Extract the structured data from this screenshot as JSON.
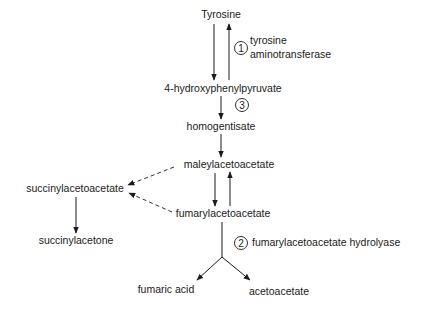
{
  "diagram": {
    "type": "metabolic-pathway",
    "nodes": {
      "tyrosine": "Tyrosine",
      "hydroxyphenylpyruvate": "4-hydroxyphenylpyruvate",
      "homogentisate": "homogentisate",
      "maleylacetoacetate": "maleylacetoacetate",
      "fumarylacetoacetate": "fumarylacetoacetate",
      "succinylacetoacetate": "succinylacetoacetate",
      "succinylacetone": "succinylacetone",
      "fumaric_acid": "fumaric acid",
      "acetoacetate": "acetoacetate"
    },
    "enzymes": [
      {
        "number": "1",
        "line1": "tyrosine",
        "line2": "aminotransferase"
      },
      {
        "number": "2",
        "line1": "fumarylacetoacetate hydrolyase"
      },
      {
        "number": "3"
      }
    ],
    "edges": [
      {
        "from": "Tyrosine",
        "to": "4-hydroxyphenylpyruvate",
        "style": "solid",
        "reversible": true,
        "enzyme": "1"
      },
      {
        "from": "4-hydroxyphenylpyruvate",
        "to": "homogentisate",
        "style": "solid",
        "enzyme": "3"
      },
      {
        "from": "homogentisate",
        "to": "maleylacetoacetate",
        "style": "solid"
      },
      {
        "from": "maleylacetoacetate",
        "to": "fumarylacetoacetate",
        "style": "solid",
        "reversible": true
      },
      {
        "from": "maleylacetoacetate",
        "to": "succinylacetoacetate",
        "style": "dashed"
      },
      {
        "from": "fumarylacetoacetate",
        "to": "succinylacetoacetate",
        "style": "dashed"
      },
      {
        "from": "succinylacetoacetate",
        "to": "succinylacetone",
        "style": "solid"
      },
      {
        "from": "fumarylacetoacetate",
        "to": "fumaric acid",
        "style": "solid",
        "enzyme": "2"
      },
      {
        "from": "fumarylacetoacetate",
        "to": "acetoacetate",
        "style": "solid",
        "enzyme": "2"
      }
    ]
  }
}
